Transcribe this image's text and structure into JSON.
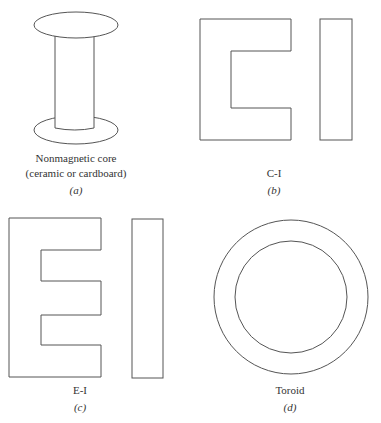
{
  "figure": {
    "panels": [
      {
        "id": "a",
        "title": "Nonmagnetic core",
        "subtitle": "(ceramic or cardboard)",
        "tag": "(a)",
        "shape": "spool"
      },
      {
        "id": "b",
        "title": "C-I",
        "tag": "(b)",
        "shape": "c-core-with-i-bar"
      },
      {
        "id": "c",
        "title": "E-I",
        "tag": "(c)",
        "shape": "e-core-with-i-bar"
      },
      {
        "id": "d",
        "title": "Toroid",
        "tag": "(d)",
        "shape": "toroid"
      }
    ],
    "stroke_color": "#555555",
    "background": "#ffffff"
  }
}
